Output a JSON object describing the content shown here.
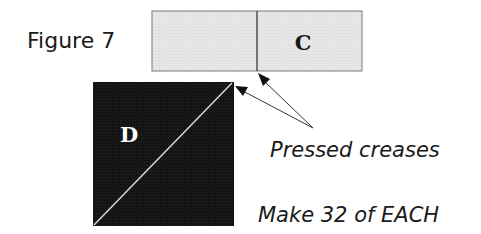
{
  "figure": {
    "label": "Figure 7"
  },
  "pieces": {
    "rectangle": {
      "letter": "C",
      "fill": "#e6e6e6",
      "stroke": "#7a7a7a"
    },
    "square": {
      "letter": "D",
      "fill": "#121212",
      "diagonal_color": "#d8d8d8",
      "letter_color": "#ffffff"
    }
  },
  "annotations": {
    "crease_note": "Pressed creases",
    "quantity_note": "Make 32 of EACH"
  },
  "colors": {
    "arrow": "#333333",
    "text": "#1a1a1a"
  }
}
